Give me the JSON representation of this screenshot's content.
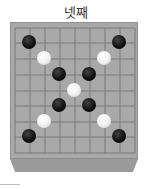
{
  "title": "넷째",
  "board": {
    "surface_color": "#a9a9a9",
    "line_color": "#7a7a7a",
    "columns_x": [
      4,
      19,
      34,
      49,
      64,
      79,
      94,
      109,
      124
    ],
    "rows_y": [
      5,
      20,
      36,
      52,
      68,
      83,
      99,
      114,
      130
    ],
    "stones": [
      {
        "color": "black",
        "col": 1,
        "row": 1
      },
      {
        "color": "black",
        "col": 7,
        "row": 1
      },
      {
        "color": "white",
        "col": 2,
        "row": 2
      },
      {
        "color": "white",
        "col": 6,
        "row": 2
      },
      {
        "color": "black",
        "col": 3,
        "row": 3
      },
      {
        "color": "black",
        "col": 5,
        "row": 3
      },
      {
        "color": "white",
        "col": 4,
        "row": 4
      },
      {
        "color": "black",
        "col": 3,
        "row": 5
      },
      {
        "color": "black",
        "col": 5,
        "row": 5
      },
      {
        "color": "white",
        "col": 2,
        "row": 6
      },
      {
        "color": "white",
        "col": 6,
        "row": 6
      },
      {
        "color": "black",
        "col": 1,
        "row": 7
      },
      {
        "color": "black",
        "col": 7,
        "row": 7
      }
    ]
  }
}
